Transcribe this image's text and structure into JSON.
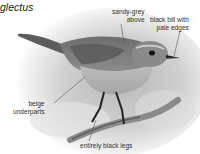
{
  "title": {
    "species_fragment": "glectus"
  },
  "annotations": [
    {
      "id": "sandy",
      "line1": "sandy-grey",
      "line2": "above"
    },
    {
      "id": "bill",
      "line1": "black bill with",
      "line2": "pale edges"
    },
    {
      "id": "beige",
      "line1": "beige",
      "line2": "underparts"
    },
    {
      "id": "legs",
      "line1": "entirely black legs"
    }
  ],
  "colors": {
    "background": "#ffffff",
    "text": "#333333",
    "callout_line": "#555555",
    "vignette": "#c8c8c8"
  }
}
